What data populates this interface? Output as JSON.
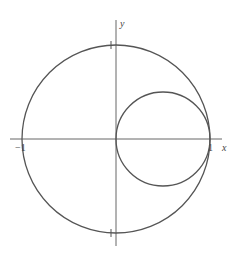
{
  "diagram": {
    "axes": {
      "x_label": "x",
      "y_label": "y",
      "tick_labels": {
        "x_pos": "1",
        "x_neg": "−1",
        "y_pos": "1",
        "y_neg": "−1"
      }
    },
    "curves": [
      {
        "name": "unit-circle",
        "center": [
          0,
          0
        ],
        "radius": 1
      },
      {
        "name": "small-circle",
        "center": [
          0.5,
          0
        ],
        "radius": 0.5
      }
    ],
    "colors": {
      "stroke": "#555555",
      "background": "#ffffff"
    }
  }
}
